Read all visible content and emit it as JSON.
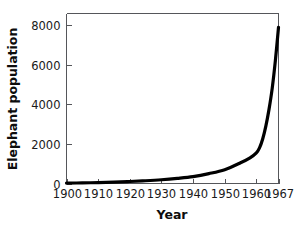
{
  "chart_data": {
    "type": "line",
    "title": "",
    "xlabel": "Year",
    "ylabel": "Elephant population",
    "xlim": [
      1900,
      1967
    ],
    "ylim": [
      0,
      8600
    ],
    "grid": false,
    "legend": false,
    "x_ticks": [
      1900,
      1910,
      1920,
      1930,
      1940,
      1950,
      1960,
      1967
    ],
    "x_tick_labels": [
      "1900",
      "1910",
      "1920",
      "1930",
      "1940",
      "1950",
      "1960",
      "1967"
    ],
    "y_ticks": [
      0,
      2000,
      4000,
      6000,
      8000
    ],
    "y_tick_labels": [
      "0",
      "2000",
      "4000",
      "6000",
      "8000"
    ],
    "series": [
      {
        "name": "Elephant population",
        "color": "#000000",
        "x": [
          1900,
          1905,
          1910,
          1915,
          1920,
          1925,
          1930,
          1935,
          1940,
          1945,
          1950,
          1955,
          1958,
          1960,
          1961,
          1962,
          1963,
          1964,
          1965,
          1966,
          1967
        ],
        "values": [
          20,
          30,
          45,
          70,
          100,
          140,
          190,
          260,
          350,
          500,
          700,
          1050,
          1300,
          1550,
          1800,
          2250,
          2900,
          3750,
          4800,
          6200,
          7900
        ]
      }
    ]
  },
  "labels": {
    "x_axis_title": "Year",
    "y_axis_title": "Elephant population"
  }
}
